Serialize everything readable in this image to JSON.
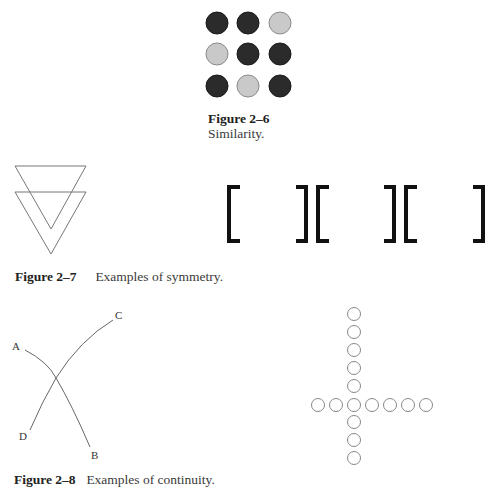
{
  "figure_2_6": {
    "number": "Figure 2–6",
    "caption": "Similarity.",
    "grid": [
      [
        "dark",
        "dark",
        "light"
      ],
      [
        "light",
        "dark",
        "dark"
      ],
      [
        "dark",
        "light",
        "dark"
      ]
    ],
    "colors": {
      "dark": "#2b2b2b",
      "light": "#c9c9c9",
      "light_border": "#8a8a8a"
    }
  },
  "figure_2_7": {
    "number": "Figure 2–7",
    "caption": "Examples of symmetry.",
    "triangles": "two overlapping downward-pointing triangles",
    "brackets": [
      "[",
      "]",
      "[",
      "]",
      "[",
      "]"
    ]
  },
  "figure_2_8": {
    "number": "Figure 2–8",
    "caption": "Examples of continuity.",
    "curve_labels": {
      "a": "A",
      "b": "B",
      "c": "C",
      "d": "D"
    },
    "cross": {
      "vertical_circles": 9,
      "horizontal_circles": 7
    }
  }
}
